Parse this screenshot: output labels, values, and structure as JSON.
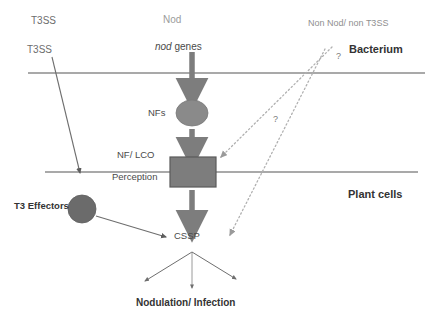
{
  "diagram": {
    "compartments": {
      "bacterium_label": "Bacterium",
      "plant_label": "Plant cells"
    },
    "labels": {
      "t3ss_top": "T3SS",
      "t3ss_second": "T3SS",
      "nod": "Nod",
      "nod_genes_italic": "nod",
      "nod_genes_rest": " genes",
      "non_nod_non_t3ss": "Non Nod/ non T3SS",
      "nfs": "NFs",
      "nf_lco": "NF/ LCO",
      "perception": "Perception",
      "t3_effectors": "T3 Effectors",
      "cssp": "CSSP",
      "nodulation_infection": "Nodulation/ Infection",
      "question_upper": "?",
      "question_lower": "?"
    },
    "colors": {
      "background": "#ffffff",
      "membrane_line": "#8c8c8c",
      "arrow_thick": "#7d7d7d",
      "arrow_thin": "#6e6e6e",
      "dotted_line": "#b0b0b0",
      "nfs_ellipse_fill": "#8a8a8a",
      "perception_box_fill": "#7d7d7d",
      "perception_box_stroke": "#5a5a5a",
      "effector_circle_fill": "#6b6b6b",
      "text_dark": "#333333",
      "text_mid": "#4a4a4a",
      "text_gray": "#6d6d6d",
      "text_light": "#9b9b9b"
    },
    "shapes": {
      "nfs_ellipse": {
        "cx": 192,
        "cy": 113,
        "rx": 16,
        "ry": 13
      },
      "perception_box": {
        "x": 170,
        "y": 157,
        "width": 46,
        "height": 30
      },
      "effector_circle": {
        "cx": 82,
        "cy": 209,
        "r": 14
      }
    },
    "membranes": [
      {
        "name": "bacterium-membrane",
        "x1": 28,
        "y1": 73,
        "x2": 425,
        "y2": 73
      },
      {
        "name": "plant-membrane",
        "x1": 45,
        "y1": 172,
        "x2": 418,
        "y2": 172
      }
    ],
    "arrows": {
      "nod_genes_to_nfs": {
        "from": [
          192,
          52
        ],
        "to": [
          192,
          96
        ]
      },
      "nfs_to_perception": {
        "from": [
          192,
          128
        ],
        "to": [
          192,
          155
        ]
      },
      "perception_to_cssp": {
        "from": [
          192,
          189
        ],
        "to": [
          192,
          228
        ]
      },
      "t3ss_injection": {
        "from": [
          52,
          57
        ],
        "to": [
          80,
          176
        ]
      },
      "effector_to_cssp": {
        "from": [
          96,
          216
        ],
        "to": [
          168,
          238
        ]
      },
      "cssp_fan_left": {
        "from": [
          192,
          252
        ],
        "to": [
          143,
          282
        ]
      },
      "cssp_fan_center": {
        "from": [
          192,
          252
        ],
        "to": [
          192,
          290
        ]
      },
      "cssp_fan_right": {
        "from": [
          192,
          252
        ],
        "to": [
          238,
          280
        ]
      },
      "dotted_to_perception": {
        "from": [
          330,
          48
        ],
        "to": [
          219,
          158
        ]
      },
      "dotted_to_cssp": {
        "from": [
          323,
          50
        ],
        "to": [
          228,
          236
        ]
      }
    }
  }
}
